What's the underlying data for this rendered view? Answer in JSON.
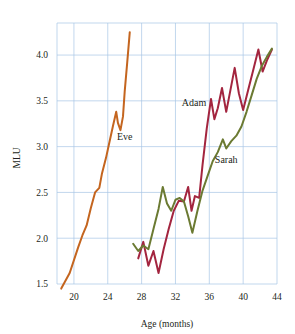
{
  "chart_data": {
    "type": "line",
    "title": "",
    "xlabel": "Age (months)",
    "ylabel": "MLU",
    "xlim": [
      18,
      44
    ],
    "ylim": [
      1.5,
      4.35
    ],
    "xticks": [
      20,
      24,
      28,
      32,
      36,
      40,
      44
    ],
    "yticks": [
      1.5,
      2.0,
      2.5,
      3.0,
      3.5,
      4.0
    ],
    "xtick_labels": [
      "20",
      "24",
      "28",
      "32",
      "36",
      "40",
      "44"
    ],
    "ytick_labels": [
      "1.5",
      "2.0",
      "2.5",
      "3.0",
      "3.5",
      "4.0"
    ],
    "grid": true,
    "legend_position": "inline-annotations",
    "series": [
      {
        "name": "Eve",
        "color": "#c4651f",
        "label_x": 26.0,
        "label_y": 3.07,
        "points": [
          [
            18.5,
            1.45
          ],
          [
            19.5,
            1.62
          ],
          [
            20.5,
            1.9
          ],
          [
            21.0,
            2.03
          ],
          [
            21.5,
            2.14
          ],
          [
            22.0,
            2.33
          ],
          [
            22.5,
            2.5
          ],
          [
            23.0,
            2.55
          ],
          [
            23.3,
            2.7
          ],
          [
            23.8,
            2.88
          ],
          [
            24.2,
            3.05
          ],
          [
            24.6,
            3.22
          ],
          [
            25.0,
            3.38
          ],
          [
            25.2,
            3.26
          ],
          [
            25.5,
            3.18
          ],
          [
            25.8,
            3.33
          ],
          [
            26.0,
            3.6
          ],
          [
            26.3,
            3.92
          ],
          [
            26.6,
            4.25
          ]
        ]
      },
      {
        "name": "Adam",
        "color": "#a3253f",
        "label_x": 34.2,
        "label_y": 3.44,
        "points": [
          [
            27.6,
            1.78
          ],
          [
            28.2,
            1.96
          ],
          [
            28.8,
            1.7
          ],
          [
            29.4,
            1.86
          ],
          [
            30.0,
            1.62
          ],
          [
            30.6,
            1.88
          ],
          [
            31.2,
            2.1
          ],
          [
            31.8,
            2.3
          ],
          [
            32.4,
            2.41
          ],
          [
            33.0,
            2.4
          ],
          [
            33.5,
            2.56
          ],
          [
            33.9,
            2.3
          ],
          [
            34.3,
            2.46
          ],
          [
            34.8,
            2.44
          ],
          [
            35.2,
            2.8
          ],
          [
            35.7,
            3.2
          ],
          [
            36.2,
            3.52
          ],
          [
            36.6,
            3.3
          ],
          [
            37.0,
            3.42
          ],
          [
            37.5,
            3.64
          ],
          [
            38.0,
            3.38
          ],
          [
            38.5,
            3.62
          ],
          [
            39.0,
            3.86
          ],
          [
            39.5,
            3.58
          ],
          [
            40.0,
            3.4
          ],
          [
            40.6,
            3.62
          ],
          [
            41.2,
            3.84
          ],
          [
            41.8,
            4.06
          ],
          [
            42.3,
            3.82
          ],
          [
            42.8,
            3.94
          ],
          [
            43.4,
            4.06
          ]
        ]
      },
      {
        "name": "Sarah",
        "color": "#6b7a32",
        "label_x": 38.0,
        "label_y": 2.82,
        "points": [
          [
            27.0,
            1.94
          ],
          [
            27.6,
            1.86
          ],
          [
            28.2,
            1.92
          ],
          [
            28.8,
            1.88
          ],
          [
            29.4,
            2.1
          ],
          [
            30.0,
            2.32
          ],
          [
            30.5,
            2.56
          ],
          [
            31.0,
            2.38
          ],
          [
            31.5,
            2.3
          ],
          [
            32.0,
            2.42
          ],
          [
            32.5,
            2.44
          ],
          [
            33.0,
            2.4
          ],
          [
            33.5,
            2.24
          ],
          [
            34.0,
            2.06
          ],
          [
            34.6,
            2.3
          ],
          [
            35.2,
            2.52
          ],
          [
            35.8,
            2.68
          ],
          [
            36.4,
            2.84
          ],
          [
            37.0,
            2.94
          ],
          [
            37.6,
            3.08
          ],
          [
            38.0,
            2.98
          ],
          [
            38.6,
            3.06
          ],
          [
            39.2,
            3.12
          ],
          [
            39.8,
            3.22
          ],
          [
            40.4,
            3.38
          ],
          [
            41.0,
            3.56
          ],
          [
            41.6,
            3.74
          ],
          [
            42.2,
            3.88
          ],
          [
            42.8,
            3.98
          ],
          [
            43.4,
            4.07
          ]
        ]
      }
    ]
  }
}
